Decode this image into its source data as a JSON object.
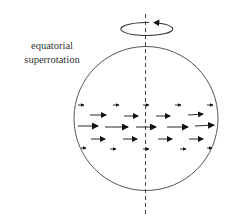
{
  "diagram": {
    "title_label_line1": "equatorial",
    "title_label_line2": "superrotation",
    "elements": {
      "rotation_indicator": "counter-clockwise rotation arrow around axis",
      "planet": "circle (sphere outline)",
      "axis": "dashed vertical rotation axis",
      "wind_arrows": "rows of eastward arrows, longest at equator"
    },
    "colors": {
      "stroke": "#444444",
      "arrow": "#111111",
      "text": "#333333"
    }
  }
}
